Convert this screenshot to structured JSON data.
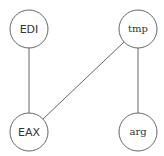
{
  "diagram": {
    "nodes": [
      {
        "id": "EDI",
        "label": "EDI",
        "cx": 29,
        "cy": 29
      },
      {
        "id": "tmp",
        "label": "tmp",
        "cx": 138,
        "cy": 29
      },
      {
        "id": "EAX",
        "label": "EAX",
        "cx": 29,
        "cy": 132
      },
      {
        "id": "arg",
        "label": "arg",
        "cx": 138,
        "cy": 132
      }
    ],
    "edges": [
      {
        "from": "EDI",
        "to": "EAX"
      },
      {
        "from": "tmp",
        "to": "EAX"
      },
      {
        "from": "tmp",
        "to": "arg"
      }
    ],
    "stroke_color": "#666666"
  }
}
